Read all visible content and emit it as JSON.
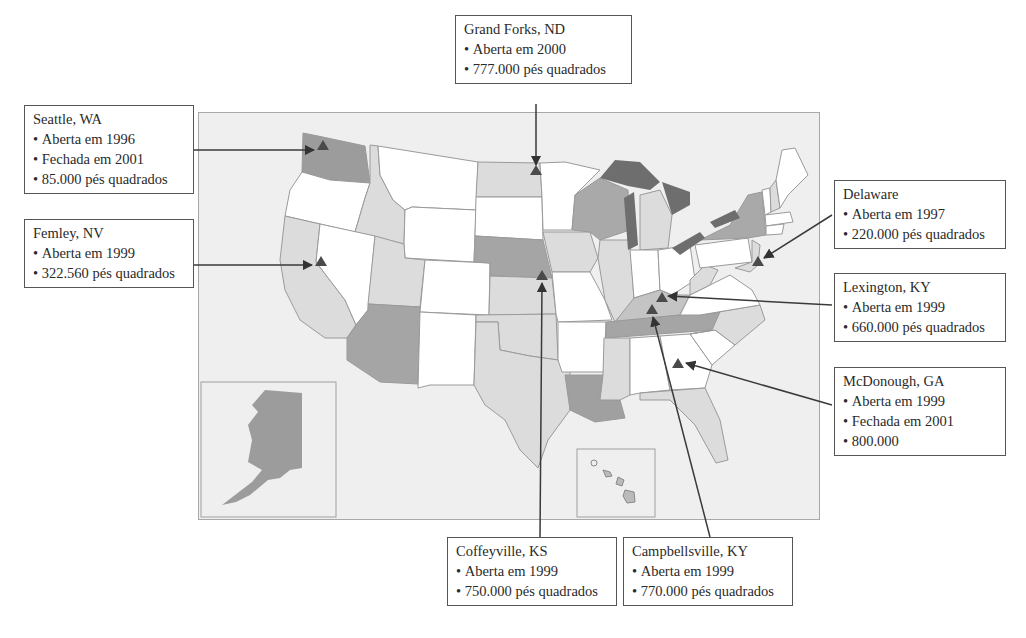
{
  "map": {
    "title": "",
    "regions": [
      "contiguous-us",
      "alaska-inset",
      "hawaii-inset"
    ],
    "colors": {
      "background": "#efefef",
      "state_white": "#ffffff",
      "state_light": "#dcdcdc",
      "state_medium": "#a9a9a9",
      "state_dark": "#8a8a8a",
      "lakes": "#6e6e6e",
      "marker": "#4a4a4a",
      "leader_line": "#444444"
    },
    "marker_icon": "triangle-marker"
  },
  "callouts": {
    "seattle": {
      "title": "Seattle, WA",
      "lines": [
        "Aberta em 1996",
        "Fechada em 2001",
        "85.000 pés quadrados"
      ]
    },
    "fernley": {
      "title": "Femley, NV",
      "lines": [
        "Aberta em 1999",
        "322.560 pés quadrados"
      ]
    },
    "grand_forks": {
      "title": "Grand Forks, ND",
      "lines": [
        "Aberta em 2000",
        "777.000 pés quadrados"
      ]
    },
    "delaware": {
      "title": "Delaware",
      "lines": [
        "Aberta em 1997",
        "220.000 pés quadrados"
      ]
    },
    "lexington": {
      "title": "Lexington, KY",
      "lines": [
        "Aberta em 1999",
        "660.000 pés quadrados"
      ]
    },
    "mcdonough": {
      "title": "McDonough, GA",
      "lines": [
        "Aberta em 1999",
        "Fechada em 2001",
        "800.000"
      ]
    },
    "coffeyville": {
      "title": "Coffeyville, KS",
      "lines": [
        "Aberta em 1999",
        "750.000 pés quadrados"
      ]
    },
    "campbellsville": {
      "title": "Campbellsville, KY",
      "lines": [
        "Aberta em 1999",
        "770.000 pés quadrados"
      ]
    }
  }
}
